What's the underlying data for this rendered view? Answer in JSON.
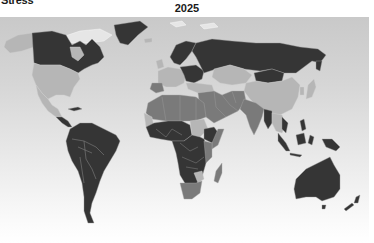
{
  "header": {
    "title_fragment": "Stress",
    "year": "2025"
  },
  "map": {
    "subject": "Water Stress",
    "year": "2025",
    "projection": "world",
    "color_scale": {
      "high": "#353535",
      "medium": "#7a7a7a",
      "low": "#b6b6b6",
      "no_data": "#e6e6e6"
    },
    "background_gradient": [
      "#c9c9c9",
      "#ffffff"
    ],
    "regions": [
      {
        "name": "Canada",
        "class": "high"
      },
      {
        "name": "Greenland",
        "class": "high"
      },
      {
        "name": "Alaska",
        "class": "low"
      },
      {
        "name": "United States",
        "class": "low"
      },
      {
        "name": "Mexico",
        "class": "low"
      },
      {
        "name": "Central America",
        "class": "high"
      },
      {
        "name": "South America",
        "class": "high"
      },
      {
        "name": "Scandinavia",
        "class": "high"
      },
      {
        "name": "Western Europe",
        "class": "low"
      },
      {
        "name": "Eastern Europe",
        "class": "high"
      },
      {
        "name": "Russia",
        "class": "high"
      },
      {
        "name": "Central Asia",
        "class": "low"
      },
      {
        "name": "Mongolia",
        "class": "high"
      },
      {
        "name": "China",
        "class": "low"
      },
      {
        "name": "Middle East",
        "class": "medium"
      },
      {
        "name": "India",
        "class": "medium"
      },
      {
        "name": "Southeast Asia",
        "class": "high"
      },
      {
        "name": "North Africa",
        "class": "medium"
      },
      {
        "name": "West Africa",
        "class": "high"
      },
      {
        "name": "Sudan",
        "class": "low"
      },
      {
        "name": "Ethiopia",
        "class": "high"
      },
      {
        "name": "East Africa",
        "class": "medium"
      },
      {
        "name": "Central Africa",
        "class": "high"
      },
      {
        "name": "Zimbabwe",
        "class": "low"
      },
      {
        "name": "South Africa",
        "class": "medium"
      },
      {
        "name": "Madagascar",
        "class": "medium"
      },
      {
        "name": "Indonesia",
        "class": "high"
      },
      {
        "name": "Papua New Guinea",
        "class": "high"
      },
      {
        "name": "Australia",
        "class": "high"
      },
      {
        "name": "New Zealand",
        "class": "high"
      }
    ]
  }
}
